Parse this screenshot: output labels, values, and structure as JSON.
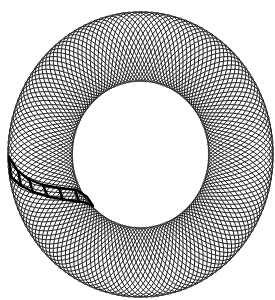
{
  "figure": {
    "description": "Ring (torus-like band) of interlaced closed curves forming a diamond lattice with a highlighted strip of cells on the left",
    "colors": {
      "background": "#ffffff",
      "line": "#222222",
      "highlight": "#000000"
    },
    "ring": {
      "cx": 140.5,
      "cy": 154.5,
      "scale_x": 0.93,
      "mid_radius": 108,
      "amplitude": 35,
      "lobes": 6,
      "curve_count": 12,
      "segments": 72
    },
    "highlight_strip": {
      "outer_edge": [
        [
          9,
          157
        ],
        [
          17,
          170
        ],
        [
          28,
          179
        ],
        [
          43,
          185
        ],
        [
          60,
          188
        ],
        [
          77,
          190
        ],
        [
          87,
          197
        ],
        [
          93,
          206
        ]
      ],
      "inner_edge": [
        [
          11,
          177
        ],
        [
          20,
          185
        ],
        [
          33,
          192
        ],
        [
          50,
          197
        ],
        [
          67,
          200
        ],
        [
          83,
          202
        ],
        [
          93,
          206
        ]
      ],
      "rungs": [
        [
          [
            9,
            157
          ],
          [
            11,
            177
          ]
        ],
        [
          [
            18,
            171
          ],
          [
            21,
            186
          ]
        ],
        [
          [
            29,
            179
          ],
          [
            33,
            192
          ]
        ],
        [
          [
            43,
            185
          ],
          [
            48,
            197
          ]
        ],
        [
          [
            59,
            188
          ],
          [
            63,
            200
          ]
        ],
        [
          [
            75,
            190
          ],
          [
            79,
            202
          ]
        ]
      ]
    }
  }
}
